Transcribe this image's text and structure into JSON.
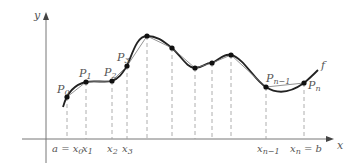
{
  "diagram": {
    "axes": {
      "x_label": "x",
      "y_label": "y"
    },
    "curve_label": "f",
    "points": [
      {
        "label": "P",
        "sub": "0",
        "x": 67,
        "y": 97
      },
      {
        "label": "P",
        "sub": "1",
        "x": 86,
        "y": 82
      },
      {
        "label": "P",
        "sub": "2",
        "x": 112,
        "y": 81
      },
      {
        "label": "P",
        "sub": "3",
        "x": 127,
        "y": 66
      },
      {
        "label": "",
        "sub": "",
        "x": 147,
        "y": 36
      },
      {
        "label": "",
        "sub": "",
        "x": 172,
        "y": 48
      },
      {
        "label": "",
        "sub": "",
        "x": 195,
        "y": 68
      },
      {
        "label": "",
        "sub": "",
        "x": 212,
        "y": 63
      },
      {
        "label": "",
        "sub": "",
        "x": 231,
        "y": 55
      },
      {
        "label": "P",
        "sub": "n−1",
        "x": 266,
        "y": 87
      },
      {
        "label": "P",
        "sub": "n",
        "x": 304,
        "y": 83
      }
    ],
    "x_tick_labels": [
      {
        "text_main": "a = x",
        "sub": "0",
        "x": 52
      },
      {
        "text_main": "x",
        "sub": "1",
        "x": 82
      },
      {
        "text_main": "x",
        "sub": "2",
        "x": 107
      },
      {
        "text_main": "x",
        "sub": "3",
        "x": 122
      },
      {
        "text_main": "x",
        "sub": "n−1",
        "x": 257
      },
      {
        "text_main": "x",
        "sub": "n",
        "text_after": " = b",
        "x": 290
      }
    ]
  }
}
